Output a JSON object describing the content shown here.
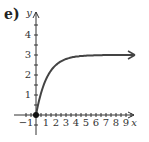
{
  "label": "e)",
  "chart_data": {
    "type": "line",
    "title": "",
    "xlabel": "x",
    "ylabel": "y",
    "xlim": [
      -1,
      10
    ],
    "ylim": [
      -1,
      5
    ],
    "x_ticks": [
      -1,
      1,
      2,
      3,
      4,
      5,
      6,
      7,
      8,
      9
    ],
    "y_ticks": [
      1,
      2,
      3,
      4
    ],
    "grid": false,
    "series": [
      {
        "name": "curve",
        "x": [
          0,
          0.5,
          1,
          1.5,
          2,
          2.5,
          3,
          4,
          5,
          6,
          7,
          8,
          9,
          9.8
        ],
        "y": [
          0,
          1.3,
          2.0,
          2.4,
          2.65,
          2.8,
          2.9,
          2.97,
          2.99,
          3.0,
          3.0,
          3.0,
          3.0,
          3.0
        ]
      }
    ],
    "annotations": [
      "closed dot at (0,0)",
      "arrow toward y=3 as x increases"
    ]
  }
}
